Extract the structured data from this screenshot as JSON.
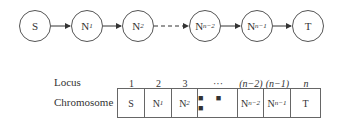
{
  "graph": {
    "nodes": [
      {
        "id": "S",
        "label": "S",
        "sub": ""
      },
      {
        "id": "N1",
        "label": "N",
        "sub": "1"
      },
      {
        "id": "N2",
        "label": "N",
        "sub": "2"
      },
      {
        "id": "Nn-2",
        "label": "N",
        "sub": "n−2"
      },
      {
        "id": "Nn-1",
        "label": "N",
        "sub": "n−1"
      },
      {
        "id": "T",
        "label": "T",
        "sub": ""
      }
    ],
    "edges": [
      {
        "from": "S",
        "to": "N1",
        "style": "solid"
      },
      {
        "from": "N1",
        "to": "N2",
        "style": "solid"
      },
      {
        "from": "N2",
        "to": "Nn-2",
        "style": "dashed"
      },
      {
        "from": "Nn-2",
        "to": "Nn-1",
        "style": "solid"
      },
      {
        "from": "Nn-1",
        "to": "T",
        "style": "solid"
      }
    ]
  },
  "table": {
    "row_labels": {
      "locus": "Locus",
      "chromosome": "Chromosome"
    },
    "loci": [
      "1",
      "2",
      "3",
      "···",
      "(n−2)",
      "(n−1)",
      "n"
    ],
    "cells": [
      {
        "label": "S",
        "sub": ""
      },
      {
        "label": "N",
        "sub": "1"
      },
      {
        "label": "N",
        "sub": "2"
      },
      {
        "label": "■ ■ ■",
        "sub": ""
      },
      {
        "label": "N",
        "sub": "n−2"
      },
      {
        "label": "N",
        "sub": "n−1"
      },
      {
        "label": "T",
        "sub": ""
      }
    ]
  }
}
